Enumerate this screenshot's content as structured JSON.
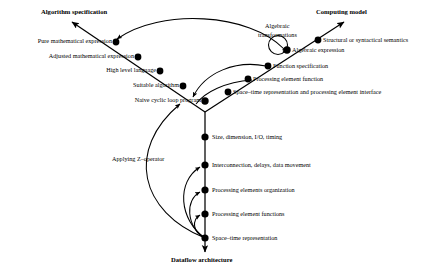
{
  "diagram": {
    "title_nodes": {
      "top_left": "Algorithm specification",
      "top_right": "Computing model",
      "bottom": "Dataflow architecture"
    },
    "left_branch": {
      "name": "algorithm-specification-branch",
      "labels": [
        "Pure mathematical expression",
        "Adjusted mathematical expression",
        "High level language",
        "Suitable algorithm",
        "Naive cyclic loop program"
      ]
    },
    "right_branch": {
      "name": "computing-model-branch",
      "labels": [
        "Structural or syntactical semantics",
        "Algebraic expression",
        "Function specification",
        "Processing element function",
        "Space–time representation and processing element interface"
      ]
    },
    "bottom_branch": {
      "name": "dataflow-architecture-branch",
      "labels": [
        "Size, dimension, I/O, timing",
        "Interconnection, delays, data movement",
        "Processing elements organization",
        "Processing element functions",
        "Space–time representation"
      ]
    },
    "annotations": [
      "Algebraic",
      "transformations",
      "Applying Z–operator"
    ],
    "annotation_algebraic_line1": "Algebraic",
    "annotation_algebraic_line2": "transformations",
    "annotation_z_operator": "Applying Z–operator",
    "colors": {
      "stroke": "#000000",
      "background": "#ffffff",
      "node_fill": "#000000"
    }
  }
}
